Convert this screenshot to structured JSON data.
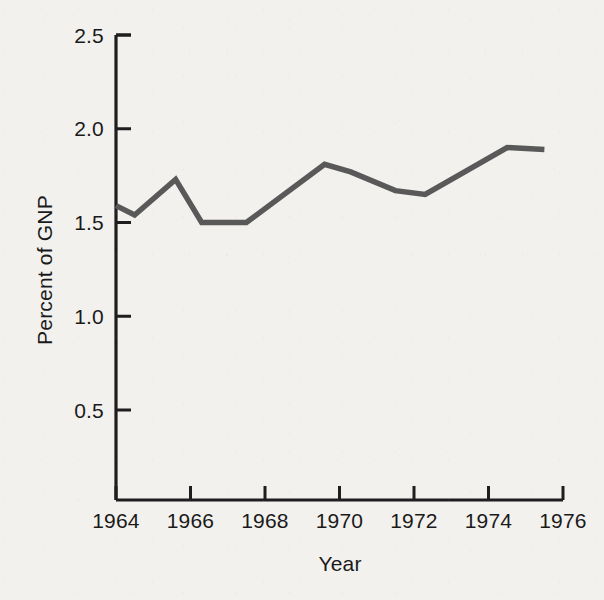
{
  "chart_data": {
    "type": "line",
    "title": "",
    "subtitle": "",
    "xlabel": "Year",
    "ylabel": "Percent of GNP",
    "xlim": [
      1964,
      1976
    ],
    "ylim": [
      0.0,
      2.5
    ],
    "grid": false,
    "legend": null,
    "x_ticks": [
      1964,
      1966,
      1968,
      1970,
      1972,
      1974,
      1976
    ],
    "x_tick_labels": [
      "1964",
      "1966",
      "1968",
      "1970",
      "1972",
      "1974",
      "1976"
    ],
    "y_ticks": [
      0.5,
      1.0,
      1.5,
      2.0,
      2.5
    ],
    "y_tick_labels": [
      "0.5",
      "1.0",
      "1.5",
      "2.0",
      "2.5"
    ],
    "series": [
      {
        "name": "Percent of GNP",
        "color": "#595959",
        "x": [
          1964.0,
          1964.5,
          1965.6,
          1966.3,
          1967.5,
          1969.6,
          1970.3,
          1971.5,
          1972.3,
          1974.5,
          1975.5
        ],
        "values": [
          1.59,
          1.54,
          1.73,
          1.5,
          1.5,
          1.81,
          1.77,
          1.67,
          1.65,
          1.9,
          1.89
        ]
      }
    ],
    "annotations": []
  },
  "axes": {
    "y_axis_name": "y-axis",
    "x_axis_name": "x-axis",
    "tick_direction_y": "inward",
    "tick_direction_x": "outward"
  },
  "style": {
    "background_color": "#f2f1ee",
    "axis_color": "#1e1e1e",
    "line_color": "#595959",
    "text_color": "#1a1a1a"
  }
}
